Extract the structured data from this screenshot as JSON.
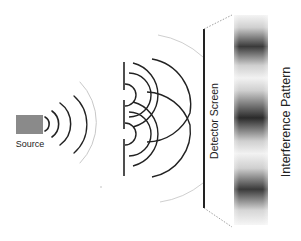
{
  "diagram": {
    "labels": {
      "source": "Source",
      "detector_screen": "Detector Screen",
      "interference_pattern": "Interference Pattern"
    },
    "colors": {
      "background": "#ffffff",
      "line_dark": "#222222",
      "line_faint": "#c8c8c8",
      "source_fill": "#8a8a8a",
      "pattern_dark": "#2a2a2a",
      "pattern_light": "#f4f4f4"
    },
    "components": [
      {
        "id": "source",
        "label": "Source"
      },
      {
        "id": "double-slit-barrier",
        "slits": 2
      },
      {
        "id": "detector-screen",
        "label": "Detector Screen"
      },
      {
        "id": "interference-pattern",
        "label": "Interference Pattern",
        "bright_dark_bands": 3
      }
    ]
  }
}
